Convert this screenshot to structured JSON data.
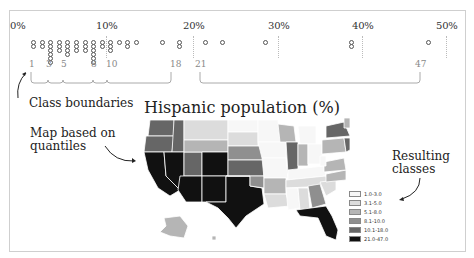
{
  "axis": {
    "ticks": [
      {
        "label": "0%",
        "x": 10
      },
      {
        "label": "10%",
        "x": 96
      },
      {
        "label": "20%",
        "x": 183
      },
      {
        "label": "30%",
        "x": 268
      },
      {
        "label": "40%",
        "x": 352
      },
      {
        "label": "50%",
        "x": 436
      }
    ]
  },
  "boundaries": {
    "labels": [
      "1",
      "3",
      "5",
      "8",
      "10",
      "18",
      "21",
      "47"
    ]
  },
  "annotations": {
    "class_boundaries": "Class boundaries",
    "map_based_line1": "Map based on",
    "map_based_line2": "quantiles",
    "resulting_line1": "Resulting",
    "resulting_line2": "classes"
  },
  "map": {
    "title": "Hispanic population (%)"
  },
  "legend": {
    "items": [
      {
        "label": "1.0-3.0",
        "color": "#f7f7f7"
      },
      {
        "label": "3.1-5.0",
        "color": "#dcdcdc"
      },
      {
        "label": "5.1-8.0",
        "color": "#b5b5b5"
      },
      {
        "label": "8.1-10.0",
        "color": "#8f8f8f"
      },
      {
        "label": "10.1-18.0",
        "color": "#666666"
      },
      {
        "label": "21.0-47.0",
        "color": "#111111"
      }
    ]
  },
  "chart_data": {
    "type": "scatter",
    "title": "Hispanic population (%)",
    "xlabel": "",
    "ylabel": "",
    "xlim": [
      0,
      50
    ],
    "x_ticks": [
      "0%",
      "10%",
      "20%",
      "30%",
      "40%",
      "50%"
    ],
    "class_boundaries": [
      1,
      3,
      5,
      8,
      10,
      18,
      21,
      47
    ],
    "classes": [
      "1.0-3.0",
      "3.1-5.0",
      "5.1-8.0",
      "8.1-10.0",
      "10.1-18.0",
      "21.0-47.0"
    ],
    "approx_values": [
      1,
      1,
      2,
      2,
      3,
      3,
      3,
      3,
      3,
      3,
      4,
      4,
      4,
      5,
      5,
      5,
      5,
      6,
      6,
      6,
      7,
      7,
      7,
      8,
      8,
      8,
      8,
      8,
      8,
      9,
      9,
      10,
      10,
      10,
      11,
      12,
      12,
      13,
      16,
      18,
      18,
      21,
      23,
      28,
      38,
      38,
      47
    ],
    "grid": false
  }
}
